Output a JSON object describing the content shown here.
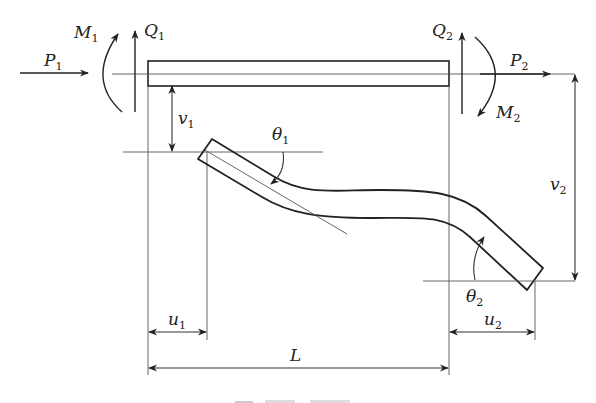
{
  "figure": {
    "caption_visible": "(caption cropped at bottom edge)"
  },
  "labels": {
    "P1": {
      "main": "P",
      "sub": "1"
    },
    "M1": {
      "main": "M",
      "sub": "1"
    },
    "Q1": {
      "main": "Q",
      "sub": "1"
    },
    "Q2": {
      "main": "Q",
      "sub": "2"
    },
    "P2": {
      "main": "P",
      "sub": "2"
    },
    "M2": {
      "main": "M",
      "sub": "2"
    },
    "v1": {
      "main": "v",
      "sub": "1"
    },
    "v2": {
      "main": "v",
      "sub": "2"
    },
    "theta1": {
      "main": "θ",
      "sub": "1"
    },
    "theta2": {
      "main": "θ",
      "sub": "2"
    },
    "u1": {
      "main": "u",
      "sub": "1"
    },
    "u2": {
      "main": "u",
      "sub": "2"
    },
    "L": {
      "main": "L",
      "sub": ""
    }
  },
  "colors": {
    "stroke": "#222222",
    "thin": "#555555",
    "background": "#ffffff"
  }
}
